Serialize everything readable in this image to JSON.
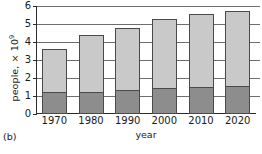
{
  "figure": {
    "panel_letter": "(b)",
    "ylabel_text": "people, × 10",
    "ylabel_exponent": "9",
    "xlabel": "year"
  },
  "chart_data": {
    "type": "bar",
    "stacked": true,
    "title": "",
    "xlabel": "year",
    "ylabel": "people, × 10⁹",
    "categories": [
      "1970",
      "1980",
      "1990",
      "2000",
      "2010",
      "2020"
    ],
    "ylim": [
      0,
      6
    ],
    "yticks": [
      "0",
      "1",
      "2",
      "3",
      "4",
      "5",
      "6"
    ],
    "grid": true,
    "legend": "none",
    "series": [
      {
        "name": "lower-segment",
        "color": "#8d8d8d",
        "values": [
          1.1,
          1.1,
          1.2,
          1.35,
          1.4,
          1.45
        ]
      },
      {
        "name": "upper-segment",
        "color": "#c9c9c9",
        "values": [
          2.5,
          3.3,
          3.6,
          3.95,
          4.15,
          4.3
        ]
      }
    ],
    "totals": [
      3.6,
      4.4,
      4.8,
      5.3,
      5.55,
      5.75
    ]
  },
  "colors": {
    "upper": "#c9c9c9",
    "lower": "#8d8d8d",
    "outline": "#4a4a4a",
    "grid": "#6e6e6e",
    "axis": "#2b2b2b",
    "text": "#1a1a1a",
    "background": "#ffffff"
  }
}
